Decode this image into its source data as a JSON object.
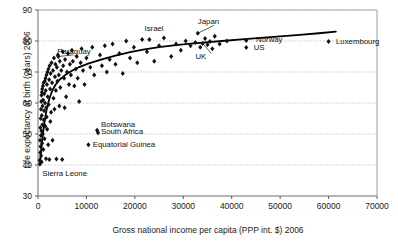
{
  "chart_data": {
    "type": "scatter",
    "title": "",
    "subtitle": "",
    "xlabel": "Gross national income per capita (PPP int. $) 2006",
    "ylabel": "Life expectancy at birth (years) 2006",
    "xlim": [
      0,
      70000
    ],
    "ylim": [
      30,
      90
    ],
    "xticks": [
      0,
      10000,
      20000,
      30000,
      40000,
      50000,
      60000,
      70000
    ],
    "yticks": [
      30,
      40,
      50,
      60,
      70,
      80,
      90
    ],
    "xtick_labels": [
      "0",
      "10000",
      "20000",
      "30000",
      "40000",
      "50000",
      "60000",
      "70000"
    ],
    "ytick_labels": [
      "30",
      "40",
      "50",
      "60",
      "70",
      "80",
      "90"
    ],
    "grid": "horizontal-dotted",
    "legend": "none",
    "marker": "diamond",
    "marker_color": "#111111",
    "trend_color": "#000000",
    "trend_label": "logarithmic fit",
    "trend_points": [
      [
        380,
        40.0
      ],
      [
        700,
        45.5
      ],
      [
        1050,
        50.5
      ],
      [
        1400,
        54.5
      ],
      [
        1800,
        58.0
      ],
      [
        2300,
        61.2
      ],
      [
        2900,
        63.8
      ],
      [
        3600,
        65.9
      ],
      [
        4500,
        67.6
      ],
      [
        5600,
        69.0
      ],
      [
        7000,
        70.4
      ],
      [
        8500,
        71.6
      ],
      [
        10500,
        72.8
      ],
      [
        13000,
        74.0
      ],
      [
        16000,
        75.3
      ],
      [
        19000,
        76.4
      ],
      [
        22000,
        77.3
      ],
      [
        25000,
        78.0
      ],
      [
        28000,
        78.6
      ],
      [
        31000,
        79.1
      ],
      [
        34000,
        79.5
      ],
      [
        38000,
        80.0
      ],
      [
        42000,
        80.5
      ],
      [
        46000,
        81.0
      ],
      [
        50000,
        81.5
      ],
      [
        54000,
        82.0
      ],
      [
        58000,
        82.5
      ],
      [
        61500,
        83.0
      ]
    ],
    "annotations": [
      {
        "label": "Paraguay",
        "x": 4000,
        "y": 76.5,
        "anchor": "left",
        "leader": true
      },
      {
        "label": "Israel",
        "x": 22000,
        "y": 84.0,
        "anchor": "left",
        "leader": false
      },
      {
        "label": "Japan",
        "x": 33000,
        "y": 86.0,
        "anchor": "left",
        "leader": true
      },
      {
        "label": "UK",
        "x": 32500,
        "y": 75.0,
        "anchor": "left",
        "leader": true
      },
      {
        "label": "Norway",
        "x": 44000,
        "y": 80.2,
        "anchor": "marker-left",
        "leader": false
      },
      {
        "label": "US",
        "x": 43500,
        "y": 77.8,
        "anchor": "marker-left",
        "leader": false
      },
      {
        "label": "Luxembourg",
        "x": 60500,
        "y": 79.8,
        "anchor": "marker-left",
        "leader": false
      },
      {
        "label": "Botswana",
        "x": 13000,
        "y": 53.0,
        "anchor": "left",
        "leader": false
      },
      {
        "label": "South Africa",
        "x": 13000,
        "y": 50.6,
        "anchor": "left",
        "leader": false
      },
      {
        "label": "Equatorial Guinea",
        "x": 11300,
        "y": 46.5,
        "anchor": "left",
        "leader": false
      },
      {
        "label": "Sierra Leone",
        "x": 900,
        "y": 37.0,
        "anchor": "left",
        "leader": false
      }
    ],
    "named_points": [
      {
        "name": "Paraguay",
        "x": 4200,
        "y": 75.0
      },
      {
        "name": "Israel",
        "x": 23000,
        "y": 80.5
      },
      {
        "name": "Japan",
        "x": 33000,
        "y": 82.5
      },
      {
        "name": "UK",
        "x": 34000,
        "y": 79.2
      },
      {
        "name": "Norway",
        "x": 43000,
        "y": 80.2
      },
      {
        "name": "US",
        "x": 43000,
        "y": 77.9
      },
      {
        "name": "Luxembourg",
        "x": 60000,
        "y": 79.8
      },
      {
        "name": "Botswana",
        "x": 12200,
        "y": 51.2
      },
      {
        "name": "South Africa",
        "x": 12400,
        "y": 50.4
      },
      {
        "name": "Equatorial Guinea",
        "x": 10400,
        "y": 46.5
      },
      {
        "name": "Sierra Leone",
        "x": 750,
        "y": 41.0
      }
    ],
    "points": [
      [
        330,
        41.5
      ],
      [
        380,
        40.3
      ],
      [
        420,
        48.0
      ],
      [
        450,
        44.0
      ],
      [
        480,
        52.0
      ],
      [
        520,
        46.0
      ],
      [
        560,
        55.0
      ],
      [
        600,
        49.5
      ],
      [
        620,
        58.0
      ],
      [
        650,
        43.0
      ],
      [
        680,
        60.5
      ],
      [
        700,
        51.0
      ],
      [
        720,
        62.5
      ],
      [
        750,
        41.0
      ],
      [
        780,
        56.0
      ],
      [
        800,
        63.5
      ],
      [
        840,
        47.0
      ],
      [
        880,
        64.5
      ],
      [
        900,
        53.0
      ],
      [
        940,
        59.0
      ],
      [
        980,
        50.0
      ],
      [
        1020,
        65.5
      ],
      [
        1060,
        61.0
      ],
      [
        1100,
        45.0
      ],
      [
        1150,
        66.5
      ],
      [
        1200,
        54.5
      ],
      [
        1250,
        57.5
      ],
      [
        1300,
        63.0
      ],
      [
        1350,
        48.5
      ],
      [
        1400,
        67.0
      ],
      [
        1450,
        60.0
      ],
      [
        1500,
        52.5
      ],
      [
        1550,
        68.0
      ],
      [
        1600,
        64.0
      ],
      [
        1650,
        42.0
      ],
      [
        1700,
        58.5
      ],
      [
        1750,
        69.0
      ],
      [
        1800,
        55.5
      ],
      [
        1850,
        66.0
      ],
      [
        1900,
        51.5
      ],
      [
        1950,
        70.0
      ],
      [
        2000,
        62.0
      ],
      [
        2100,
        46.5
      ],
      [
        2150,
        71.0
      ],
      [
        2200,
        59.5
      ],
      [
        2300,
        67.5
      ],
      [
        2350,
        41.8
      ],
      [
        2400,
        72.0
      ],
      [
        2500,
        64.5
      ],
      [
        2550,
        54.0
      ],
      [
        2600,
        69.5
      ],
      [
        2700,
        57.0
      ],
      [
        2800,
        73.0
      ],
      [
        2900,
        66.5
      ],
      [
        3000,
        48.0
      ],
      [
        3100,
        70.5
      ],
      [
        3200,
        61.5
      ],
      [
        3300,
        74.5
      ],
      [
        3400,
        58.0
      ],
      [
        3500,
        68.5
      ],
      [
        3600,
        72.5
      ],
      [
        3700,
        64.0
      ],
      [
        3800,
        41.9
      ],
      [
        3900,
        71.5
      ],
      [
        4000,
        67.0
      ],
      [
        4100,
        75.5
      ],
      [
        4200,
        75.0
      ],
      [
        4300,
        69.0
      ],
      [
        4400,
        59.0
      ],
      [
        4500,
        73.5
      ],
      [
        4600,
        65.0
      ],
      [
        4800,
        70.5
      ],
      [
        5000,
        41.8
      ],
      [
        5100,
        76.5
      ],
      [
        5200,
        72.0
      ],
      [
        5400,
        68.0
      ],
      [
        5500,
        58.5
      ],
      [
        5600,
        74.0
      ],
      [
        5800,
        62.0
      ],
      [
        6000,
        70.0
      ],
      [
        6200,
        76.0
      ],
      [
        6400,
        66.0
      ],
      [
        6600,
        72.5
      ],
      [
        6800,
        69.0
      ],
      [
        7000,
        77.0
      ],
      [
        7200,
        73.5
      ],
      [
        7500,
        65.5
      ],
      [
        7800,
        71.0
      ],
      [
        8000,
        75.0
      ],
      [
        8200,
        68.0
      ],
      [
        8500,
        60.5
      ],
      [
        8800,
        73.0
      ],
      [
        9000,
        77.5
      ],
      [
        9300,
        70.5
      ],
      [
        9600,
        66.0
      ],
      [
        10000,
        74.5
      ],
      [
        10400,
        46.5
      ],
      [
        10800,
        71.5
      ],
      [
        11200,
        78.0
      ],
      [
        11600,
        69.0
      ],
      [
        12200,
        51.2
      ],
      [
        12400,
        50.4
      ],
      [
        12800,
        75.5
      ],
      [
        13200,
        72.0
      ],
      [
        13800,
        78.5
      ],
      [
        14200,
        70.0
      ],
      [
        14800,
        74.0
      ],
      [
        15400,
        79.0
      ],
      [
        16000,
        72.5
      ],
      [
        16800,
        76.0
      ],
      [
        17500,
        69.5
      ],
      [
        18200,
        80.0
      ],
      [
        19000,
        74.5
      ],
      [
        19800,
        78.0
      ],
      [
        20500,
        73.0
      ],
      [
        21500,
        80.5
      ],
      [
        22500,
        76.5
      ],
      [
        23000,
        80.5
      ],
      [
        24000,
        73.5
      ],
      [
        25000,
        78.5
      ],
      [
        26000,
        81.0
      ],
      [
        27500,
        75.0
      ],
      [
        28500,
        79.0
      ],
      [
        29500,
        77.0
      ],
      [
        30500,
        80.0
      ],
      [
        31500,
        78.5
      ],
      [
        32500,
        79.5
      ],
      [
        33000,
        82.5
      ],
      [
        33500,
        78.0
      ],
      [
        34000,
        79.2
      ],
      [
        34500,
        80.8
      ],
      [
        35000,
        78.8
      ],
      [
        35500,
        79.8
      ],
      [
        36000,
        77.5
      ],
      [
        36500,
        81.5
      ],
      [
        37500,
        79.0
      ],
      [
        39000,
        80.0
      ],
      [
        43000,
        80.2
      ],
      [
        43000,
        77.9
      ],
      [
        60000,
        79.8
      ]
    ]
  }
}
